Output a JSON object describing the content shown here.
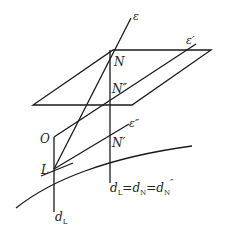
{
  "diagram": {
    "type": "geometric-figure",
    "labels": {
      "epsilon": "ε",
      "epsilon_prime": "ε′",
      "epsilon_double_prime": "ε″",
      "N": "N",
      "N_double_prime": "N″",
      "N_prime": "N′",
      "O": "O",
      "L": "L",
      "d_L": "d",
      "d_L_sub": "L",
      "equation_d1": "d",
      "equation_sub1": "L",
      "equation_eq1": "=",
      "equation_d2": "d",
      "equation_sub2": "N",
      "equation_eq2": "=",
      "equation_d3": "d",
      "equation_sub3": "N",
      "equation_sup3": "″"
    },
    "colors": {
      "stroke": "#1a1a1a",
      "background": "#ffffff"
    }
  }
}
